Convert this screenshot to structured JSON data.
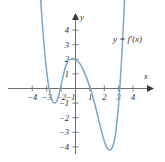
{
  "figure": {
    "kind": "cartesian-graph",
    "background_color": "#ffffff",
    "curve_color": "#7ba7c7",
    "axis_color": "#6e6e72",
    "text_color": "#2e2e32",
    "curve_label": "y = f′(x)",
    "x_axis_name": "x",
    "y_axis_name": "y"
  },
  "chart_data": {
    "type": "line",
    "title": "",
    "subtitle": "",
    "xlabel": "x",
    "ylabel": "y",
    "legend": [
      "y = f′(x)"
    ],
    "legend_position": "upper-right-inside",
    "grid": false,
    "xlim": [
      -4.7,
      4.7
    ],
    "ylim": [
      -4.9,
      4.9
    ],
    "x_ticks": [
      -4,
      -3,
      -2,
      -1,
      1,
      2,
      3,
      4
    ],
    "x_tick_labels": [
      "−4",
      "−3",
      "−2",
      "−1",
      "1",
      "2",
      "3",
      "4"
    ],
    "y_ticks": [
      -4,
      -3,
      -2,
      -1,
      1,
      2,
      3,
      4
    ],
    "y_tick_labels": [
      "−4",
      "−3",
      "−2",
      "−1",
      "1",
      "2",
      "3",
      "4"
    ],
    "series": [
      {
        "name": "y = f′(x)",
        "color": "#7ba7c7",
        "x": [
          -2.55,
          -2.45,
          -2.35,
          -2.25,
          -2.15,
          -2.05,
          -1.95,
          -1.85,
          -1.75,
          -1.65,
          -1.55,
          -1.45,
          -1.35,
          -1.25,
          -1.15,
          -1.05,
          -0.95,
          -0.85,
          -0.75,
          -0.6,
          -0.45,
          -0.3,
          -0.15,
          0.0,
          0.15,
          0.3,
          0.45,
          0.6,
          0.75,
          0.9,
          1.05,
          1.2,
          1.35,
          1.5,
          1.65,
          1.8,
          1.95,
          2.1,
          2.25,
          2.4,
          2.55,
          2.7,
          2.8,
          2.9,
          3.0,
          3.1,
          3.2,
          3.3,
          3.4,
          3.5
        ],
        "y": [
          8.1,
          6.5,
          5.1,
          3.8,
          2.6,
          1.6,
          0.75,
          0.1,
          -0.4,
          -0.75,
          -0.95,
          -1.0,
          -0.93,
          -0.73,
          -0.4,
          0.0,
          0.45,
          0.9,
          1.3,
          1.72,
          1.95,
          2.02,
          2.05,
          2.0,
          1.88,
          1.7,
          1.45,
          1.14,
          0.78,
          0.38,
          -0.05,
          -0.55,
          -1.1,
          -1.7,
          -2.3,
          -2.9,
          -3.45,
          -3.88,
          -4.15,
          -4.22,
          -4.05,
          -3.55,
          -2.95,
          -2.1,
          -1.0,
          0.4,
          2.0,
          3.85,
          6.0,
          8.4
        ],
        "note": "Quartic-shaped derivative curve: steep descent from upper left, local minimum near (-1.5, -1.0), local maximum near (-0.15, 2.05), deep local minimum near (2.4, -4.2), steep ascent through x = 3."
      }
    ],
    "annotations": [
      {
        "text": "y = f′(x)",
        "x": 3.3,
        "y": 3.1
      }
    ],
    "zero_crossings": [
      -2.1,
      -1.05,
      1.03,
      3.03
    ],
    "local_extrema": [
      {
        "type": "minimum",
        "x": -1.45,
        "y": -1.0
      },
      {
        "type": "maximum",
        "x": -0.15,
        "y": 2.05
      },
      {
        "type": "minimum",
        "x": 2.4,
        "y": -4.22
      }
    ]
  }
}
